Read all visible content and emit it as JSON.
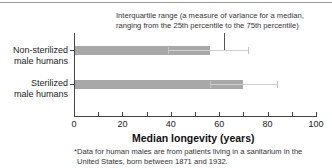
{
  "chart_data": {
    "type": "bar",
    "orientation": "horizontal",
    "categories": [
      "Non-sterilized male humans",
      "Sterilized male humans"
    ],
    "series": [
      {
        "name": "Median longevity (years)",
        "values": [
          56,
          70
        ]
      }
    ],
    "error_bars": {
      "type": "interquartile range",
      "lower": [
        39,
        56
      ],
      "upper": [
        72,
        84
      ]
    },
    "xlabel": "Median longevity (years)",
    "ylabel": "",
    "xlim": [
      0,
      100
    ],
    "xticks": [
      0,
      20,
      40,
      60,
      80,
      100
    ],
    "annotation": "Interquartile range (a measure of variance for a median, ranging from the 25th percentile to the 75th percentile)",
    "footnote": "*Data for human males are from patients living in a sanitarium in the United States, born between 1871 and 1932.",
    "grid": false,
    "legend": "none",
    "bar_color": "#a8a8a8"
  },
  "labels": {
    "annotation_line1": "Interquartile range (a measure of variance for a median,",
    "annotation_line2": "ranging from the 25th percentile to the 75th percentile)",
    "cat0_line1": "Non-sterilized",
    "cat0_line2": "male humans",
    "cat1_line1": "Sterilized",
    "cat1_line2": "male humans",
    "xticks": [
      "0",
      "20",
      "40",
      "60",
      "80",
      "100"
    ],
    "xlabel": "Median longevity (years)",
    "foot_line1": "*Data for human males are from patients living in a sanitarium in the",
    "foot_line2": "United States, born between 1871 and 1932."
  }
}
